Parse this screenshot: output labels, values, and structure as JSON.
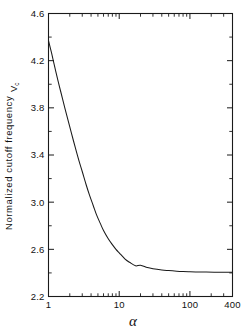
{
  "chart_data": {
    "type": "line",
    "title": "",
    "xlabel": "α",
    "ylabel": "Normalized cutoff frequency",
    "ylabel_symbol": "V",
    "ylabel_symbol_sub": "c",
    "xscale": "log",
    "yscale": "linear",
    "xlim": [
      1,
      400
    ],
    "ylim": [
      2.2,
      4.6
    ],
    "grid": false,
    "legend": null,
    "xticks": [
      1,
      10,
      100,
      400
    ],
    "xtick_labels": [
      "1",
      "10",
      "100",
      "400"
    ],
    "xminor_ticks": [
      2,
      3,
      4,
      5,
      6,
      7,
      8,
      9,
      20,
      30,
      40,
      50,
      60,
      70,
      80,
      90,
      200,
      300
    ],
    "yticks": [
      2.2,
      2.6,
      3.0,
      3.4,
      3.8,
      4.2,
      4.6
    ],
    "ytick_labels": [
      "2.2",
      "2.6",
      "3.0",
      "3.4",
      "3.8",
      "4.2",
      "4.6"
    ],
    "yminor_ticks": [
      2.4,
      2.8,
      3.2,
      3.6,
      4.0,
      4.4
    ],
    "series": [
      {
        "name": "Normalized cutoff frequency",
        "color": "#1a1a1a",
        "x": [
          1.0,
          1.1,
          1.2,
          1.35,
          1.5,
          1.7,
          1.9,
          2.1,
          2.4,
          2.7,
          3.0,
          3.4,
          3.8,
          4.3,
          4.8,
          5.4,
          6.0,
          7.0,
          8.0,
          9.0,
          10.0,
          12.0,
          14.0,
          17.0,
          20.0,
          25.0,
          30.0,
          40.0,
          50.0,
          65.0,
          80.0,
          100.0,
          130.0,
          170.0,
          220.0,
          280.0,
          400.0
        ],
        "y": [
          4.37,
          4.27,
          4.17,
          4.04,
          3.93,
          3.8,
          3.69,
          3.59,
          3.46,
          3.35,
          3.26,
          3.15,
          3.06,
          2.97,
          2.89,
          2.82,
          2.76,
          2.69,
          2.64,
          2.6,
          2.57,
          2.52,
          2.49,
          2.46,
          2.465,
          2.445,
          2.435,
          2.425,
          2.42,
          2.415,
          2.412,
          2.41,
          2.408,
          2.407,
          2.406,
          2.406,
          2.405
        ]
      }
    ],
    "asymptote_value": 2.405,
    "start_value": 4.37
  },
  "figure": {
    "background_color": "#ffffff",
    "axis_color": "#1a1a1a"
  }
}
